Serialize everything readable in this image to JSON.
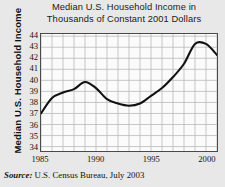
{
  "chart_data": {
    "type": "line",
    "title": "Median U.S. Household Income in Thousands of Constant 2001 Dollars",
    "title_lines": [
      "Median U.S. Household Income in",
      "Thousands of Constant 2001 Dollars"
    ],
    "xlabel": "",
    "ylabel": "Median U.S. Household Income",
    "xlim": [
      1985,
      2001
    ],
    "ylim": [
      33.6,
      44.2
    ],
    "ytick_values": [
      34,
      35,
      36,
      37,
      38,
      39,
      40,
      41,
      42,
      43,
      44
    ],
    "ytick_labels": [
      "34",
      "35",
      "36",
      "37",
      "38",
      "39",
      "40",
      "41",
      "42",
      "43",
      "44"
    ],
    "xtick_values": [
      1985,
      1990,
      1995,
      2000
    ],
    "xtick_labels": [
      "1985",
      "1990",
      "1995",
      "2000"
    ],
    "grid": true,
    "grid_x_step": 1,
    "grid_y_step": 1,
    "legend": "none",
    "line_color": "#111111",
    "grid_color": "#b9b9b9",
    "frame_color": "#4a4a4a",
    "plot_background": "#fbfbfb",
    "page_background": "#e8e8e8",
    "x": [
      1985,
      1986,
      1987,
      1988,
      1989,
      1990,
      1991,
      1992,
      1993,
      1994,
      1995,
      1996,
      1997,
      1998,
      1999,
      2000,
      2001
    ],
    "values": [
      37.0,
      38.4,
      38.9,
      39.2,
      39.85,
      39.3,
      38.3,
      37.9,
      37.7,
      37.9,
      38.6,
      39.3,
      40.3,
      41.5,
      43.3,
      43.3,
      42.3
    ],
    "series": [
      {
        "name": "Median U.S. Household Income",
        "values": [
          37.0,
          38.4,
          38.9,
          39.2,
          39.85,
          39.3,
          38.3,
          37.9,
          37.7,
          37.9,
          38.6,
          39.3,
          40.3,
          41.5,
          43.3,
          43.3,
          42.3
        ]
      }
    ]
  },
  "source": {
    "label": "Source:",
    "text": "U.S. Census Bureau, July 2003"
  }
}
